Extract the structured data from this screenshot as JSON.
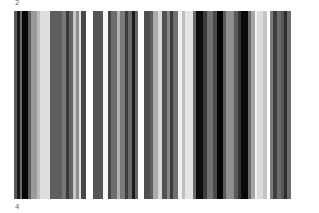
{
  "labels": {
    "top": "2",
    "bottom": "4"
  },
  "stripes": [
    {
      "w": 3,
      "c": "#5a5a5a"
    },
    {
      "w": 3,
      "c": "#1a1a1a"
    },
    {
      "w": 2,
      "c": "#6a6a6a"
    },
    {
      "w": 6,
      "c": "#050505"
    },
    {
      "w": 3,
      "c": "#5c5c5c"
    },
    {
      "w": 6,
      "c": "#9a9a9a"
    },
    {
      "w": 3,
      "c": "#bdbdbd"
    },
    {
      "w": 10,
      "c": "#dedede"
    },
    {
      "w": 12,
      "c": "#5e5e5e"
    },
    {
      "w": 4,
      "c": "#777777"
    },
    {
      "w": 3,
      "c": "#3a3a3a"
    },
    {
      "w": 4,
      "c": "#626262"
    },
    {
      "w": 3,
      "c": "#c8c8c8"
    },
    {
      "w": 3,
      "c": "#8d8d8d"
    },
    {
      "w": 2,
      "c": "#e2e2e2"
    },
    {
      "w": 5,
      "c": "#474747"
    },
    {
      "w": 7,
      "c": "#ffffff"
    },
    {
      "w": 10,
      "c": "#555555"
    },
    {
      "w": 5,
      "c": "#f4f4f4"
    },
    {
      "w": 3,
      "c": "#444444"
    },
    {
      "w": 6,
      "c": "#6d6d6d"
    },
    {
      "w": 3,
      "c": "#b2b2b2"
    },
    {
      "w": 5,
      "c": "#7a7a7a"
    },
    {
      "w": 3,
      "c": "#3d3d3d"
    },
    {
      "w": 4,
      "c": "#6b6b6b"
    },
    {
      "w": 3,
      "c": "#1c1c1c"
    },
    {
      "w": 3,
      "c": "#666666"
    },
    {
      "w": 6,
      "c": "#ffffff"
    },
    {
      "w": 6,
      "c": "#4f4f4f"
    },
    {
      "w": 3,
      "c": "#5d5d5d"
    },
    {
      "w": 5,
      "c": "#aaaaaa"
    },
    {
      "w": 4,
      "c": "#d8d8d8"
    },
    {
      "w": 5,
      "c": "#525252"
    },
    {
      "w": 3,
      "c": "#868686"
    },
    {
      "w": 3,
      "c": "#3b3b3b"
    },
    {
      "w": 5,
      "c": "#6f6f6f"
    },
    {
      "w": 4,
      "c": "#f0f0f0"
    },
    {
      "w": 3,
      "c": "#bebebe"
    },
    {
      "w": 8,
      "c": "#e5e5e5"
    },
    {
      "w": 3,
      "c": "#6e6e6e"
    },
    {
      "w": 7,
      "c": "#0c0c0c"
    },
    {
      "w": 4,
      "c": "#3c3c3c"
    },
    {
      "w": 6,
      "c": "#727272"
    },
    {
      "w": 4,
      "c": "#4a4a4a"
    },
    {
      "w": 6,
      "c": "#050505"
    },
    {
      "w": 3,
      "c": "#5a5a5a"
    },
    {
      "w": 8,
      "c": "#8f8f8f"
    },
    {
      "w": 4,
      "c": "#5b5b5b"
    },
    {
      "w": 3,
      "c": "#333333"
    },
    {
      "w": 7,
      "c": "#0a0a0a"
    },
    {
      "w": 3,
      "c": "#6a6a6a"
    },
    {
      "w": 4,
      "c": "#a5a5a5"
    },
    {
      "w": 2,
      "c": "#f5f5f5"
    },
    {
      "w": 6,
      "c": "#dcdcdc"
    },
    {
      "w": 4,
      "c": "#c4c4c4"
    },
    {
      "w": 3,
      "c": "#ffffff"
    },
    {
      "w": 3,
      "c": "#7d7d7d"
    },
    {
      "w": 4,
      "c": "#3e3e3e"
    },
    {
      "w": 4,
      "c": "#6c6c6c"
    },
    {
      "w": 3,
      "c": "#555555"
    },
    {
      "w": 3,
      "c": "#2e2e2e"
    },
    {
      "w": 4,
      "c": "#6e6e6e"
    },
    {
      "w": 2,
      "c": "#ffffff"
    }
  ]
}
